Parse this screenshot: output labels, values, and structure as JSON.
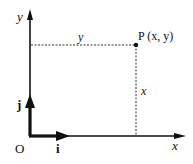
{
  "diagram": {
    "type": "coordinate-axes",
    "origin_label": "O",
    "x_axis_label": "x",
    "y_axis_label": "y",
    "unit_vector_i": "i",
    "unit_vector_j": "j",
    "point_label": "P (x, y)",
    "horizontal_distance_label": "y",
    "vertical_distance_label": "x",
    "colors": {
      "line": "#111111",
      "background": "#ffffff"
    }
  }
}
